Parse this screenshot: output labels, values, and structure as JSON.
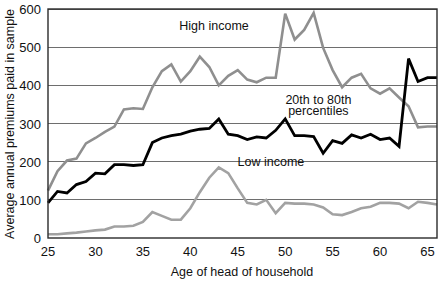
{
  "chart_data": {
    "type": "line",
    "title": "",
    "xlabel": "Age of head of household",
    "ylabel": "Average annual premiums paid in sample",
    "xlim": [
      25,
      66
    ],
    "ylim": [
      0,
      600
    ],
    "xticks": [
      25,
      30,
      35,
      40,
      45,
      50,
      55,
      60,
      65
    ],
    "yticks": [
      0,
      100,
      200,
      300,
      400,
      500,
      600
    ],
    "grid": "horizontal",
    "legend": "inline-annotations",
    "annotations": [
      {
        "text": "High income",
        "x": 42.5,
        "y": 545,
        "color": "#8a8a8a"
      },
      {
        "text": "20th to 80th",
        "x": 53.5,
        "y": 352,
        "color": "#000000"
      },
      {
        "text": "percentiles",
        "x": 53.5,
        "y": 322,
        "color": "#000000"
      },
      {
        "text": "Low income",
        "x": 48.5,
        "y": 188,
        "color": "#8a8a8a"
      }
    ],
    "x": [
      25,
      26,
      27,
      28,
      29,
      30,
      31,
      32,
      33,
      34,
      35,
      36,
      37,
      38,
      39,
      40,
      41,
      42,
      43,
      44,
      45,
      46,
      47,
      48,
      49,
      50,
      51,
      52,
      53,
      54,
      55,
      56,
      57,
      58,
      59,
      60,
      61,
      62,
      63,
      64,
      65,
      66
    ],
    "series": [
      {
        "name": "High income",
        "color": "#8f8f8f",
        "width": 2.6,
        "values": [
          124,
          175,
          203,
          208,
          248,
          262,
          278,
          292,
          337,
          340,
          338,
          395,
          437,
          455,
          410,
          437,
          475,
          448,
          400,
          425,
          440,
          415,
          408,
          420,
          420,
          588,
          520,
          545,
          590,
          498,
          440,
          395,
          420,
          430,
          392,
          378,
          392,
          368,
          345,
          290,
          292,
          292
        ]
      },
      {
        "name": "20th to 80th percentiles",
        "color": "#000000",
        "width": 2.8,
        "values": [
          92,
          122,
          118,
          140,
          148,
          170,
          168,
          192,
          192,
          190,
          192,
          250,
          262,
          268,
          272,
          280,
          285,
          287,
          312,
          272,
          268,
          258,
          265,
          262,
          282,
          312,
          268,
          268,
          266,
          222,
          255,
          248,
          270,
          262,
          272,
          258,
          262,
          240,
          470,
          410,
          420,
          420
        ]
      },
      {
        "name": "Low income",
        "color": "#a2a2a2",
        "width": 2.6,
        "values": [
          10,
          10,
          12,
          14,
          17,
          20,
          22,
          30,
          30,
          32,
          42,
          68,
          58,
          48,
          48,
          78,
          120,
          158,
          185,
          170,
          130,
          92,
          88,
          100,
          65,
          92,
          90,
          90,
          88,
          80,
          62,
          60,
          68,
          78,
          82,
          92,
          92,
          90,
          78,
          95,
          92,
          88
        ]
      }
    ]
  },
  "axis": {
    "y_label_text": "Average annual premiums paid in sample",
    "x_label_text": "Age of head of household",
    "y_tick_texts": [
      "600",
      "500",
      "400",
      "300",
      "200",
      "100",
      "0"
    ],
    "x_tick_texts": [
      "25",
      "30",
      "35",
      "40",
      "45",
      "50",
      "55",
      "60",
      "65"
    ]
  }
}
